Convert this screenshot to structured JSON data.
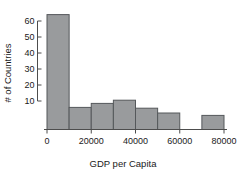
{
  "chart_data": {
    "type": "bar",
    "title": "",
    "subtitle": "",
    "xlabel": "GDP per Capita",
    "ylabel": "# of Countries",
    "categories": [
      "0-10000",
      "10000-20000",
      "20000-30000",
      "30000-40000",
      "40000-50000",
      "50000-60000",
      "60000-70000",
      "70000-80000"
    ],
    "bin_edges": [
      0,
      10000,
      20000,
      30000,
      40000,
      50000,
      60000,
      70000,
      80000
    ],
    "values": [
      64,
      6,
      8.5,
      10.5,
      5.5,
      2.5,
      0,
      1
    ],
    "bin_width": 10000,
    "xlim": [
      0,
      80000
    ],
    "ylim": [
      0,
      64
    ],
    "xticks": [
      0,
      20000,
      40000,
      60000,
      80000
    ],
    "xtick_labels": [
      "0",
      "20000",
      "40000",
      "60000",
      "80000"
    ],
    "yticks": [
      10,
      20,
      30,
      40,
      50,
      60
    ],
    "ytick_labels": [
      "10",
      "20",
      "30",
      "40",
      "50",
      "60"
    ],
    "grid": false,
    "legend": null,
    "legend_position": "none",
    "annotations": []
  },
  "style": {
    "bar_fill": "#999b9d",
    "bar_stroke": "#55585b",
    "axis_color": "#4d4d4d",
    "text_color": "#1a1a1a",
    "background": "#ffffff"
  }
}
